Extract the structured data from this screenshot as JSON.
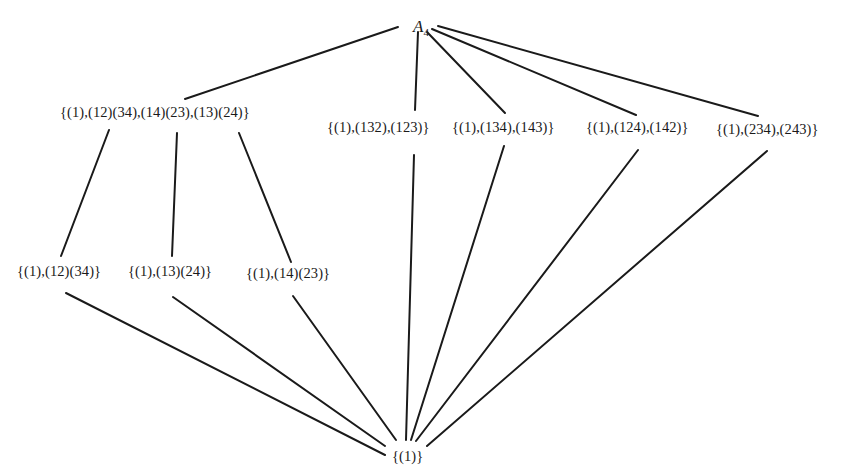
{
  "diagram": {
    "type": "subgroup-lattice",
    "group": "A4",
    "nodes": [
      {
        "id": "A4",
        "label": "A",
        "subscript": "4",
        "level": 0,
        "x": 413,
        "y": 18
      },
      {
        "id": "V4",
        "label": "{(1),(12)(34),(14)(23),(13)(24)}",
        "level": 1,
        "x": 60,
        "y": 105
      },
      {
        "id": "C3a",
        "label": "{(1),(132),(123)}",
        "level": 1,
        "x": 327,
        "y": 120
      },
      {
        "id": "C3b",
        "label": "{(1),(134),(143)}",
        "level": 1,
        "x": 452,
        "y": 120
      },
      {
        "id": "C3c",
        "label": "{(1),(124),(142)}",
        "level": 1,
        "x": 586,
        "y": 120
      },
      {
        "id": "C3d",
        "label": "{(1),(234),(243)}",
        "level": 1,
        "x": 716,
        "y": 122
      },
      {
        "id": "C2a",
        "label": "{(1),(12)(34)}",
        "level": 2,
        "x": 17,
        "y": 264
      },
      {
        "id": "C2b",
        "label": "{(1),(13)(24)}",
        "level": 2,
        "x": 128,
        "y": 264
      },
      {
        "id": "C2c",
        "label": "{(1),(14)(23)}",
        "level": 2,
        "x": 246,
        "y": 266
      },
      {
        "id": "E",
        "label": "{(1)}",
        "level": 3,
        "x": 392,
        "y": 449
      }
    ],
    "edges": [
      {
        "from": "A4",
        "to": "V4",
        "x1": 398,
        "y1": 27,
        "x2": 185,
        "y2": 99
      },
      {
        "from": "A4",
        "to": "C3a",
        "x1": 418,
        "y1": 32,
        "x2": 415,
        "y2": 110
      },
      {
        "from": "A4",
        "to": "C3b",
        "x1": 427,
        "y1": 32,
        "x2": 505,
        "y2": 113
      },
      {
        "from": "A4",
        "to": "C3c",
        "x1": 432,
        "y1": 29,
        "x2": 636,
        "y2": 115
      },
      {
        "from": "A4",
        "to": "C3d",
        "x1": 438,
        "y1": 26,
        "x2": 758,
        "y2": 116
      },
      {
        "from": "V4",
        "to": "C2a",
        "x1": 109,
        "y1": 130,
        "x2": 61,
        "y2": 256
      },
      {
        "from": "V4",
        "to": "C2b",
        "x1": 177,
        "y1": 133,
        "x2": 172,
        "y2": 256
      },
      {
        "from": "V4",
        "to": "C2c",
        "x1": 239,
        "y1": 133,
        "x2": 291,
        "y2": 262
      },
      {
        "from": "C2a",
        "to": "E",
        "x1": 66,
        "y1": 293,
        "x2": 385,
        "y2": 455
      },
      {
        "from": "C2b",
        "to": "E",
        "x1": 173,
        "y1": 297,
        "x2": 385,
        "y2": 446
      },
      {
        "from": "C2c",
        "to": "E",
        "x1": 293,
        "y1": 296,
        "x2": 396,
        "y2": 440
      },
      {
        "from": "C3a",
        "to": "E",
        "x1": 414,
        "y1": 155,
        "x2": 406,
        "y2": 440
      },
      {
        "from": "C3b",
        "to": "E",
        "x1": 504,
        "y1": 146,
        "x2": 411,
        "y2": 440
      },
      {
        "from": "C3c",
        "to": "E",
        "x1": 638,
        "y1": 150,
        "x2": 416,
        "y2": 441
      },
      {
        "from": "C3d",
        "to": "E",
        "x1": 767,
        "y1": 151,
        "x2": 427,
        "y2": 446
      }
    ]
  }
}
